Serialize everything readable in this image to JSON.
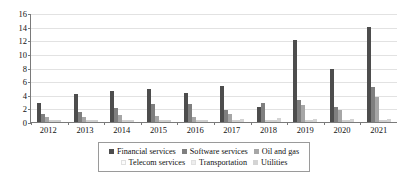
{
  "chart_data": {
    "type": "bar",
    "title": "",
    "xlabel": "",
    "ylabel": "",
    "ylim": [
      0,
      16
    ],
    "yticks": [
      0,
      2,
      4,
      6,
      8,
      10,
      12,
      14,
      16
    ],
    "grid": true,
    "legend_position": "bottom",
    "categories": [
      "2012",
      "2013",
      "2014",
      "2015",
      "2016",
      "2017",
      "2018",
      "2019",
      "2020",
      "2021"
    ],
    "series": [
      {
        "name": "Financial services",
        "color": "#4d4d4d",
        "values": [
          2.8,
          4.1,
          4.6,
          4.8,
          4.2,
          5.3,
          2.2,
          12.0,
          7.8,
          14.0
        ]
      },
      {
        "name": "Software services",
        "color": "#7f7f7f",
        "values": [
          1.2,
          1.4,
          2.1,
          2.7,
          2.6,
          1.7,
          2.8,
          3.3,
          2.2,
          5.1
        ]
      },
      {
        "name": "Oil and gas",
        "color": "#a6a6a6",
        "values": [
          0.7,
          0.8,
          1.1,
          0.9,
          0.8,
          1.2,
          0.2,
          2.5,
          1.8,
          3.7
        ]
      },
      {
        "name": "Telecom services",
        "color": "#fbfbfb",
        "values": [
          0.0,
          0.0,
          0.0,
          0.0,
          0.0,
          0.0,
          0.0,
          0.0,
          0.0,
          0.0
        ]
      },
      {
        "name": "Transportation",
        "color": "#ededed",
        "values": [
          0.1,
          0.1,
          0.1,
          0.1,
          0.1,
          0.1,
          0.1,
          0.1,
          0.1,
          0.1
        ]
      },
      {
        "name": "Utilities",
        "color": "#d4d4d4",
        "values": [
          0.2,
          0.2,
          0.35,
          0.3,
          0.3,
          0.45,
          0.55,
          0.5,
          0.5,
          0.4
        ]
      }
    ]
  },
  "axes": {
    "axis_color": "#7a7a7a",
    "grid_color": "#e2e2e2"
  },
  "legend": {
    "border_color": "#9a9a9a",
    "rows": [
      [
        {
          "label": "Financial services",
          "color": "#4d4d4d"
        },
        {
          "label": "Software services",
          "color": "#7f7f7f"
        },
        {
          "label": "Oil and gas",
          "color": "#a6a6a6"
        }
      ],
      [
        {
          "label": "Telecom services",
          "color": "#fbfbfb"
        },
        {
          "label": "Transportation",
          "color": "#ededed"
        },
        {
          "label": "Utilities",
          "color": "#d4d4d4"
        }
      ]
    ]
  }
}
